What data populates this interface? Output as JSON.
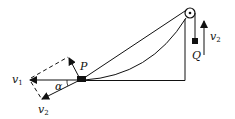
{
  "diagram": {
    "labels": {
      "P": "P",
      "Q": "Q",
      "alpha": "α",
      "v1": "v",
      "v1_sub": "1",
      "v2_left": "v",
      "v2_left_sub": "2",
      "v2_right": "v",
      "v2_right_sub": "2"
    },
    "colors": {
      "stroke": "#111111",
      "background": "#ffffff"
    }
  }
}
